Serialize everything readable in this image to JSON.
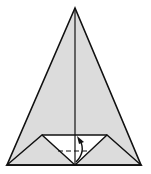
{
  "diagram": {
    "type": "origami-fold-step",
    "colors": {
      "background": "#ffffff",
      "paper_fill": "#dcdcdc",
      "inner_fill": "#ffffff",
      "stroke": "#111111"
    },
    "shapes": {
      "outer_triangle": {
        "apex": [
          75,
          8
        ],
        "bottom_left": [
          7,
          165
        ],
        "bottom_right": [
          141,
          165
        ]
      },
      "center_crease": {
        "from": [
          75,
          8
        ],
        "to": [
          75,
          135
        ]
      },
      "inner_flap": {
        "top_left": [
          42,
          135
        ],
        "top_right": [
          107,
          135
        ],
        "bottom_center": [
          75,
          165
        ]
      },
      "left_flap": {
        "points": [
          [
            7,
            165
          ],
          [
            42,
            135
          ],
          [
            75,
            165
          ]
        ]
      },
      "right_flap": {
        "points": [
          [
            141,
            165
          ],
          [
            107,
            135
          ],
          [
            75,
            165
          ]
        ]
      },
      "valley_fold_line": {
        "from": [
          58,
          151
        ],
        "to": [
          90,
          151
        ],
        "style": "dashed"
      },
      "fold_arrow": {
        "from": [
          79,
          163
        ],
        "to": [
          79,
          138
        ],
        "direction": "up"
      }
    }
  }
}
